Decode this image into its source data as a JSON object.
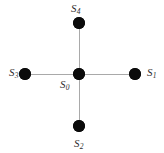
{
  "figure": {
    "background_color": "#ffffff",
    "node_color": "#0b0b0b",
    "edge_color": "#a9a9a9",
    "label_color": "#2e2e2e",
    "width": 164,
    "height": 153
  },
  "graph": {
    "type": "star",
    "node_count": 5,
    "edge_count": 4,
    "center_id": "S0",
    "nodes": [
      {
        "id": "S0",
        "symbol": "S",
        "subscript": "0",
        "label": "S₀",
        "role": "center",
        "x": 79,
        "y": 74,
        "radius": 6,
        "label_x": 60,
        "label_y": 79
      },
      {
        "id": "S1",
        "symbol": "S",
        "subscript": "1",
        "label": "S₁",
        "role": "leaf-right",
        "x": 135,
        "y": 74,
        "radius": 6,
        "label_x": 147,
        "label_y": 67
      },
      {
        "id": "S2",
        "symbol": "S",
        "subscript": "2",
        "label": "S₂",
        "role": "leaf-bottom",
        "x": 79,
        "y": 126,
        "radius": 6,
        "label_x": 74,
        "label_y": 138
      },
      {
        "id": "S3",
        "symbol": "S",
        "subscript": "3",
        "label": "S₃",
        "role": "leaf-left",
        "x": 25,
        "y": 74,
        "radius": 6,
        "label_x": 9,
        "label_y": 67
      },
      {
        "id": "S4",
        "symbol": "S",
        "subscript": "4",
        "label": "S₄",
        "role": "leaf-top",
        "x": 79,
        "y": 23,
        "radius": 6,
        "label_x": 71,
        "label_y": 3
      }
    ],
    "edges": [
      {
        "id": "e-S0-S4",
        "from": "S0",
        "to": "S4",
        "orientation": "vertical",
        "x": 79,
        "y": 23,
        "length": 51,
        "thickness": 1
      },
      {
        "id": "e-S0-S1",
        "from": "S0",
        "to": "S1",
        "orientation": "horizontal",
        "x": 79,
        "y": 74,
        "length": 56,
        "thickness": 1
      },
      {
        "id": "e-S0-S2",
        "from": "S0",
        "to": "S2",
        "orientation": "vertical",
        "x": 79,
        "y": 74,
        "length": 52,
        "thickness": 1
      },
      {
        "id": "e-S0-S3",
        "from": "S0",
        "to": "S3",
        "orientation": "horizontal",
        "x": 25,
        "y": 74,
        "length": 54,
        "thickness": 1
      }
    ]
  }
}
